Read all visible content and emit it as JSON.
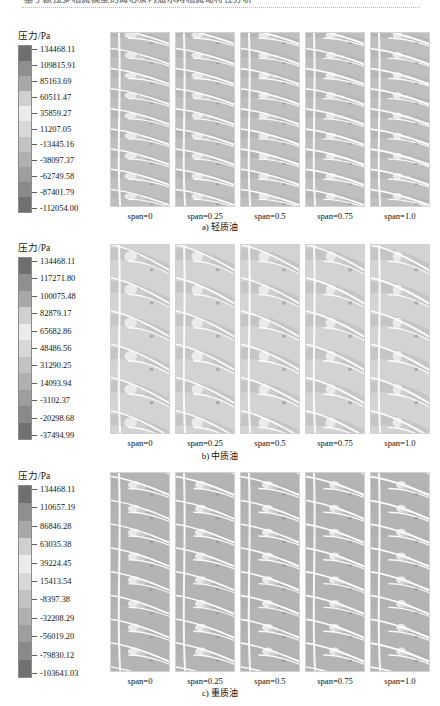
{
  "header": {
    "text": "基于欧拉多相流模型的离心泵内油水两相流动特性分析",
    "rule": "dotted-separator"
  },
  "figure": {
    "colorbar_title": "压力/Pa",
    "span_labels": [
      "span=0",
      "span=0.25",
      "span=0.5",
      "span=0.75",
      "span=1.0"
    ],
    "rows": [
      {
        "id": "a",
        "caption": "a) 轻质油",
        "colorbar_ticks": [
          "134468.11",
          "109815.91",
          "85163.69",
          "60511.47",
          "35859.27",
          "11207.05",
          "-13445.16",
          "-38097.37",
          "-62749.58",
          "-87401.79",
          "-112054.00"
        ]
      },
      {
        "id": "b",
        "caption": "b) 中质油",
        "colorbar_ticks": [
          "134468.11",
          "117271.80",
          "100075.48",
          "82879.17",
          "65682.86",
          "48486.56",
          "31290.25",
          "14093.94",
          "-3102.37",
          "-20298.68",
          "-37494.99"
        ]
      },
      {
        "id": "c",
        "caption": "c) 重质油",
        "colorbar_ticks": [
          "134468.11",
          "110657.19",
          "86846.28",
          "63035.38",
          "39224.45",
          "15413.54",
          "-8397.38",
          "-32208.29",
          "-56019.20",
          "-79830.12",
          "-103641.03"
        ]
      }
    ]
  },
  "chart_data": {
    "type": "heatmap",
    "title": "压力/Pa",
    "xlabel": "",
    "ylabel": "",
    "grid": false,
    "legend_position": "left",
    "categories": [
      "span=0",
      "span=0.25",
      "span=0.5",
      "span=0.75",
      "span=1.0"
    ],
    "series": [
      {
        "name": "a) 轻质油",
        "unit": "Pa",
        "colorbar_min": -112054.0,
        "colorbar_max": 134468.11,
        "levels": [
          134468.11,
          109815.91,
          85163.69,
          60511.47,
          35859.27,
          11207.05,
          -13445.16,
          -38097.37,
          -62749.58,
          -87401.79,
          -112054.0
        ]
      },
      {
        "name": "b) 中质油",
        "unit": "Pa",
        "colorbar_min": -37494.99,
        "colorbar_max": 134468.11,
        "levels": [
          134468.11,
          117271.8,
          100075.48,
          82879.17,
          65682.86,
          48486.56,
          31290.25,
          14093.94,
          -3102.37,
          -20298.68,
          -37494.99
        ]
      },
      {
        "name": "c) 重质油",
        "unit": "Pa",
        "colorbar_min": -103641.03,
        "colorbar_max": 134468.11,
        "levels": [
          134468.11,
          110657.19,
          86846.28,
          63035.38,
          39224.45,
          15413.54,
          -8397.38,
          -32208.29,
          -56019.2,
          -79830.12,
          -103641.03
        ]
      }
    ],
    "colormap": {
      "name": "grayscale-rainbow-converted",
      "stops": [
        "#6f6f6f",
        "#8f8f8f",
        "#a8a8a8",
        "#cfcfcf",
        "#ececec",
        "#d8d8d8",
        "#c2c2c2",
        "#b0b0b0",
        "#9d9d9d",
        "#8a8a8a",
        "#707070"
      ]
    }
  }
}
